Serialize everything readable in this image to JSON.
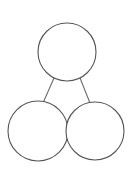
{
  "diagram": {
    "type": "part-whole-model",
    "canvas": {
      "width": 134,
      "height": 173,
      "background": "#ffffff"
    },
    "style": {
      "stroke": "#56565a",
      "stroke_light": "#6b6b70",
      "fill": "#ffffff",
      "stroke_width": 1.1
    },
    "nodes": [
      {
        "id": "whole",
        "role": "whole",
        "label": "",
        "cx": 67,
        "cy": 52,
        "r": 29
      },
      {
        "id": "part-left",
        "role": "part",
        "label": "",
        "cx": 38,
        "cy": 131,
        "r": 30
      },
      {
        "id": "part-right",
        "role": "part",
        "label": "",
        "cx": 95,
        "cy": 131,
        "r": 29
      }
    ],
    "links": [
      {
        "id": "link-left",
        "from": "whole",
        "to": "part-left",
        "x1": 54,
        "y1": 78,
        "x2": 43,
        "y2": 103
      },
      {
        "id": "link-right",
        "from": "whole",
        "to": "part-right",
        "x1": 80,
        "y1": 78,
        "x2": 90,
        "y2": 103
      }
    ]
  }
}
